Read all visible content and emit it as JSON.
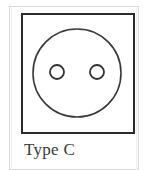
{
  "figure": {
    "caption": "Type C",
    "socket_type_letter": "C",
    "colors": {
      "plate_outline": "#2b2b2b",
      "circle_outline": "#3a3a3a",
      "hole_outline": "#333333",
      "outer_frame": "#d9d9d9",
      "background": "#ffffff",
      "caption_text": "#3a3a3a"
    },
    "shapes": {
      "plate": {
        "name": "socket-plate-square",
        "x": 21,
        "y": 13,
        "width": 114,
        "height": 121
      },
      "recess": {
        "name": "socket-recess-circle",
        "cx": 77,
        "cy": 73,
        "r": 44
      },
      "holes": [
        {
          "name": "left-pin-hole",
          "cx": 57,
          "cy": 72,
          "r": 7
        },
        {
          "name": "right-pin-hole",
          "cx": 97,
          "cy": 72,
          "r": 7
        }
      ]
    }
  }
}
